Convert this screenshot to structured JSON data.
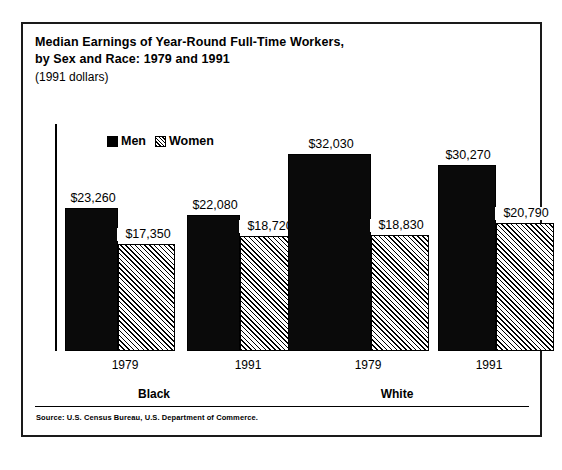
{
  "figure": {
    "title_line1": "Median Earnings of Year-Round Full-Time Workers,",
    "title_line2": "by Sex and Race:  1979 and 1991",
    "subtitle": "(1991 dollars)",
    "source": "Source:  U.S. Census Bureau, U.S. Department of Commerce."
  },
  "legend": {
    "men_label": "Men",
    "women_label": "Women",
    "men_swatch": "solid-black-square-icon",
    "women_swatch": "hatched-square-icon"
  },
  "chart_data": {
    "type": "bar",
    "title": "Median Earnings of Year-Round Full-Time Workers, by Sex and Race:  1979 and 1991",
    "subtitle": "(1991 dollars)",
    "xlabel": "",
    "ylabel": "",
    "ylim": [
      0,
      32030
    ],
    "grid": false,
    "legend_position": "top-left",
    "categories": [
      "1979",
      "1991",
      "1979",
      "1991"
    ],
    "group_labels": [
      "Black",
      "White"
    ],
    "groups": [
      {
        "race": "Black",
        "years": [
          "1979",
          "1991"
        ]
      },
      {
        "race": "White",
        "years": [
          "1979",
          "1991"
        ]
      }
    ],
    "series": [
      {
        "name": "Men",
        "values": [
          23260,
          22080,
          32030,
          30270
        ],
        "labels": [
          "$23,260",
          "$22,080",
          "$32,030",
          "$30,270"
        ],
        "fill": "solid-black"
      },
      {
        "name": "Women",
        "values": [
          17350,
          18720,
          18830,
          20790
        ],
        "labels": [
          "$17,350",
          "$18,720",
          "$18,830",
          "$20,790"
        ],
        "fill": "diagonal-hatch"
      }
    ],
    "bars": [
      {
        "group": "Black",
        "year": "1979",
        "sex": "Men",
        "value": 23260,
        "label": "$23,260"
      },
      {
        "group": "Black",
        "year": "1979",
        "sex": "Women",
        "value": 17350,
        "label": "$17,350"
      },
      {
        "group": "Black",
        "year": "1991",
        "sex": "Men",
        "value": 22080,
        "label": "$22,080"
      },
      {
        "group": "Black",
        "year": "1991",
        "sex": "Women",
        "value": 18720,
        "label": "$18,720"
      },
      {
        "group": "White",
        "year": "1979",
        "sex": "Men",
        "value": 32030,
        "label": "$32,030"
      },
      {
        "group": "White",
        "year": "1979",
        "sex": "Women",
        "value": 18830,
        "label": "$18,830"
      },
      {
        "group": "White",
        "year": "1991",
        "sex": "Men",
        "value": 30270,
        "label": "$30,270"
      },
      {
        "group": "White",
        "year": "1991",
        "sex": "Women",
        "value": 20790,
        "label": "$20,790"
      }
    ]
  },
  "axis": {
    "year_labels": [
      "1979",
      "1991",
      "1979",
      "1991"
    ],
    "race_labels": [
      "Black",
      "White"
    ]
  },
  "colors": {
    "men_fill": "#000000",
    "women_fill": "#ffffff",
    "hatch_stroke": "#000000",
    "frame": "#1a1a1a",
    "text": "#000000",
    "background": "#ffffff"
  }
}
